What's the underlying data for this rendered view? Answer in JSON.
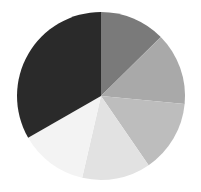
{
  "chart_data": {
    "type": "pie",
    "title": "",
    "start_angle_deg": 0,
    "direction": "clockwise",
    "categories": [
      "Slice 1",
      "Slice 2",
      "Slice 3",
      "Slice 4",
      "Slice 5",
      "Slice 6"
    ],
    "values": [
      12.6,
      13.9,
      13.9,
      13.2,
      13.1,
      33.3
    ],
    "colors": [
      "#7a7a7a",
      "#a9a9a9",
      "#bdbdbd",
      "#e2e2e2",
      "#f3f3f3",
      "#2a2a2a"
    ],
    "legend": null,
    "labels_shown": false
  },
  "layout": {
    "cx": 101,
    "cy": 96,
    "r": 84
  }
}
